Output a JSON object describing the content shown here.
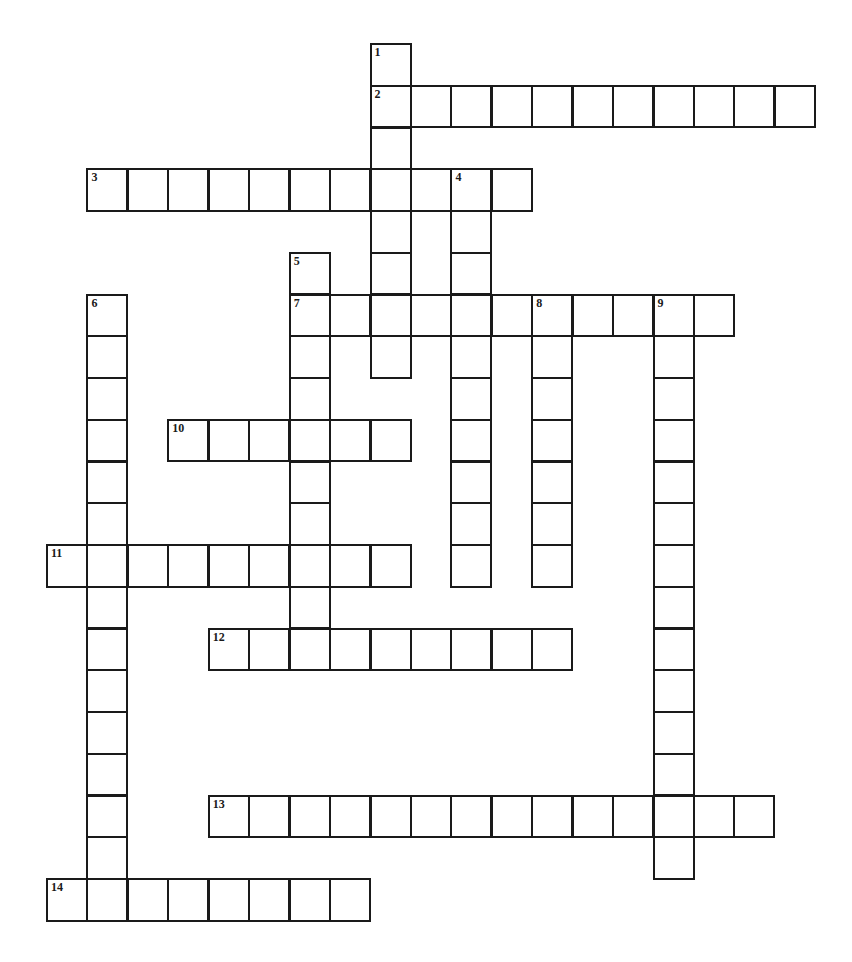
{
  "puzzle": {
    "type": "crossword",
    "grid": {
      "origin_x": 47,
      "origin_y": 44,
      "cell_w": 40.44,
      "cell_h": 41.75,
      "cols": 19,
      "rows": 21
    },
    "colors": {
      "line": "#1a1a1a",
      "background": "#ffffff"
    },
    "words": [
      {
        "number": "1",
        "direction": "down",
        "row": 0,
        "col": 8,
        "length": 8
      },
      {
        "number": "2",
        "direction": "across",
        "row": 1,
        "col": 8,
        "length": 11
      },
      {
        "number": "3",
        "direction": "across",
        "row": 3,
        "col": 1,
        "length": 11
      },
      {
        "number": "4",
        "direction": "down",
        "row": 3,
        "col": 10,
        "length": 10
      },
      {
        "number": "5",
        "direction": "down",
        "row": 5,
        "col": 6,
        "length": 10
      },
      {
        "number": "6",
        "direction": "down",
        "row": 6,
        "col": 1,
        "length": 15
      },
      {
        "number": "7",
        "direction": "across",
        "row": 6,
        "col": 6,
        "length": 11
      },
      {
        "number": "8",
        "direction": "down",
        "row": 6,
        "col": 12,
        "length": 7
      },
      {
        "number": "9",
        "direction": "down",
        "row": 6,
        "col": 15,
        "length": 14
      },
      {
        "number": "10",
        "direction": "across",
        "row": 9,
        "col": 3,
        "length": 6
      },
      {
        "number": "11",
        "direction": "across",
        "row": 12,
        "col": 0,
        "length": 9
      },
      {
        "number": "12",
        "direction": "across",
        "row": 14,
        "col": 4,
        "length": 9
      },
      {
        "number": "13",
        "direction": "across",
        "row": 18,
        "col": 4,
        "length": 14
      },
      {
        "number": "14",
        "direction": "across",
        "row": 20,
        "col": 0,
        "length": 8
      }
    ]
  }
}
